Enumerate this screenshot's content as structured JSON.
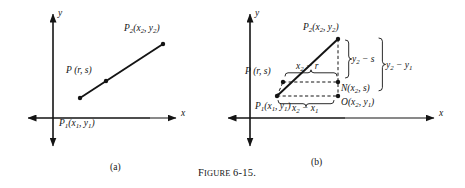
{
  "figure": {
    "caption_small_caps": "F",
    "caption_rest": "IGURE",
    "caption_number": "6-15.",
    "background_color": "#ffffff",
    "ink_color": "#141414"
  },
  "panels": [
    {
      "tag": "(a)",
      "axis_x_label": "x",
      "axis_y_label": "y",
      "points": [
        {
          "name": "P1",
          "label_main": "P",
          "label_sub": "1",
          "label_coords": "(x",
          "coord_sub1": "1",
          "coord_mid": ", y",
          "coord_sub2": "1",
          "coord_end": ")"
        },
        {
          "name": "P",
          "label_main": "P",
          "label_coords": "(r, s)"
        },
        {
          "name": "P2",
          "label_main": "P",
          "label_sub": "2",
          "label_coords": "(x",
          "coord_sub1": "2",
          "coord_mid": ", y",
          "coord_sub2": "2",
          "coord_end": ")"
        }
      ],
      "labels": {
        "p1": "P1(x1, y1)",
        "p": "P (r, s)",
        "p2": "P2(x2, y2)"
      }
    },
    {
      "tag": "(b)",
      "axis_x_label": "x",
      "axis_y_label": "y",
      "labels": {
        "p1": "P1(x1, y1)",
        "p": "P (r, s)",
        "p2": "P2(x2, y2)",
        "n": "N(x2, s)",
        "o": "O(x2, y1)",
        "seg_x2_minus_r": "x2 - r",
        "seg_x2_minus_x1": "x2 - x1",
        "seg_y2_minus_s": "y2 - s",
        "seg_y2_minus_y1": "y2 - y1"
      }
    }
  ]
}
